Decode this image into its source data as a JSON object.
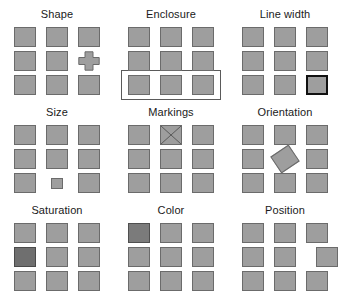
{
  "figure": {
    "background_color": "#ffffff",
    "panel_columns": 3,
    "panel_rows": 3,
    "grid_columns": 3,
    "grid_rows": 3,
    "colors": {
      "square_fill": "#9e9e9e",
      "square_stroke": "#6b6b6b",
      "saturated_fill": "#6f6f6f",
      "hue_fill": "#7b7b7b",
      "thick_stroke": "#111111",
      "enclosure_stroke": "#5a5a5a",
      "marking_stroke": "#5a5a5a",
      "label_color": "#1a1a1a"
    }
  },
  "panels": [
    {
      "id": "shape",
      "label": "Shape",
      "feature": "shape",
      "target_row": 1,
      "target_col": 2,
      "target_description": "cross-shaped glyph replaces one square"
    },
    {
      "id": "enclosure",
      "label": "Enclosure",
      "feature": "enclosure",
      "target_row": 2,
      "target_col": null,
      "target_description": "rectangle drawn around the entire bottom row"
    },
    {
      "id": "line-width",
      "label": "Line width",
      "feature": "line-width",
      "target_row": 2,
      "target_col": 2,
      "target_description": "square drawn with a thick dark outline"
    },
    {
      "id": "size",
      "label": "Size",
      "feature": "size",
      "target_row": 2,
      "target_col": 1,
      "target_description": "square rendered noticeably smaller"
    },
    {
      "id": "markings",
      "label": "Markings",
      "feature": "markings",
      "target_row": 0,
      "target_col": 1,
      "target_description": "square filled with an X cross-hatch marking"
    },
    {
      "id": "orientation",
      "label": "Orientation",
      "feature": "orientation",
      "target_row": 1,
      "target_col": 1,
      "target_description": "square rotated about 34 degrees"
    },
    {
      "id": "saturation",
      "label": "Saturation",
      "feature": "saturation",
      "target_row": 1,
      "target_col": 0,
      "target_description": "square filled with a more saturated darker tone"
    },
    {
      "id": "color",
      "label": "Color",
      "feature": "color",
      "target_row": 0,
      "target_col": 0,
      "target_description": "square filled with a different hue"
    },
    {
      "id": "position",
      "label": "Position",
      "feature": "position",
      "target_row": 1,
      "target_col": 2,
      "target_description": "square displaced to the right of its grid slot"
    }
  ]
}
